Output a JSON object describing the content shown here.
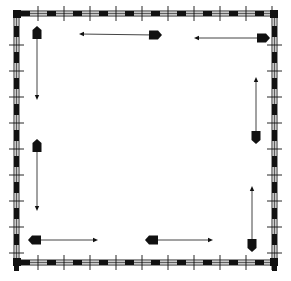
{
  "colors": {
    "background": "#ffffff",
    "ink": "#111111",
    "track_fill": "#c8c8c8",
    "line": "#444444"
  },
  "frame": {
    "outer": {
      "x1": 13,
      "y1": 10,
      "x2": 278,
      "y2": 266
    },
    "track_width": 7,
    "dash_length": 9,
    "dash_spacing": 26,
    "tie_spacing": 26
  },
  "arrows": [
    {
      "id": "top-left-down",
      "base": [
        37,
        33
      ],
      "tip": [
        37,
        100
      ]
    },
    {
      "id": "top-left-horizontal",
      "base": [
        155,
        35
      ],
      "tip": [
        79,
        34
      ]
    },
    {
      "id": "top-right-horizontal",
      "base": [
        263,
        38
      ],
      "tip": [
        194,
        38
      ]
    },
    {
      "id": "right-upper-up",
      "base": [
        256,
        137
      ],
      "tip": [
        256,
        77
      ]
    },
    {
      "id": "right-lower-up",
      "base": [
        252,
        245
      ],
      "tip": [
        252,
        186
      ]
    },
    {
      "id": "left-middle-down",
      "base": [
        37,
        146
      ],
      "tip": [
        37,
        211
      ]
    },
    {
      "id": "bottom-left-right",
      "base": [
        35,
        240
      ],
      "tip": [
        98,
        240
      ]
    },
    {
      "id": "bottom-middle-right",
      "base": [
        152,
        240
      ],
      "tip": [
        213,
        240
      ]
    }
  ],
  "labels": {
    "a11y_title": "Square track frame with eight arrows circulating inside"
  }
}
